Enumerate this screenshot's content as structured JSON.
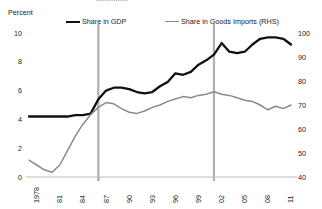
{
  "figure": {
    "clipped_title": "...............",
    "unit_label": "Percent"
  },
  "legend": {
    "position": "top",
    "items": [
      {
        "label": "Share in GDP",
        "color": "#111111",
        "axis": "left"
      },
      {
        "label": "Share in Goods Imports (RHS)",
        "color": "#8a8a8a",
        "axis": "right"
      }
    ]
  },
  "chart_data": {
    "type": "line",
    "title": "",
    "xlabel": "",
    "ylabel": "Percent",
    "ylabel_right": "",
    "grid": false,
    "legend_position": "top",
    "xlim": [
      1978,
      2012
    ],
    "ylim": [
      0,
      10
    ],
    "ylim_right": [
      40,
      100
    ],
    "xticks": [
      1978,
      1981,
      1984,
      1987,
      1990,
      1993,
      1996,
      1999,
      2002,
      2005,
      2008,
      2011
    ],
    "xtick_labels": [
      "1978",
      "81",
      "84",
      "87",
      "90",
      "93",
      "96",
      "99",
      "02",
      "05",
      "08",
      "11"
    ],
    "yticks": [
      0,
      2,
      4,
      6,
      8,
      10
    ],
    "ytick_labels": [
      "0",
      "2",
      "4",
      "6",
      "8",
      "10"
    ],
    "yticks_right": [
      40,
      50,
      60,
      70,
      80,
      90,
      100
    ],
    "ytick_labels_right": [
      "40",
      "50",
      "60",
      "70",
      "80",
      "90",
      "100"
    ],
    "annotations": [
      {
        "type": "vline",
        "x": 1987,
        "color": "#b0b0b0"
      },
      {
        "type": "vline",
        "x": 2002,
        "color": "#b0b0b0"
      }
    ],
    "x": [
      1978,
      1979,
      1980,
      1981,
      1982,
      1983,
      1984,
      1985,
      1986,
      1987,
      1988,
      1989,
      1990,
      1991,
      1992,
      1993,
      1994,
      1995,
      1996,
      1997,
      1998,
      1999,
      2000,
      2001,
      2002,
      2003,
      2004,
      2005,
      2006,
      2007,
      2008,
      2009,
      2010,
      2011,
      2012
    ],
    "series": [
      {
        "name": "Share in GDP",
        "axis": "left",
        "color": "#111111",
        "values": [
          4.2,
          4.2,
          4.2,
          4.2,
          4.2,
          4.2,
          4.3,
          4.3,
          4.4,
          5.4,
          6.0,
          6.2,
          6.2,
          6.1,
          5.9,
          5.8,
          5.9,
          6.3,
          6.6,
          7.2,
          7.1,
          7.3,
          7.8,
          8.1,
          8.5,
          9.3,
          8.7,
          8.6,
          8.7,
          9.2,
          9.6,
          9.7,
          9.7,
          9.6,
          9.2
        ]
      },
      {
        "name": "Share in Goods Imports (RHS)",
        "axis": "right",
        "color": "#8a8a8a",
        "values": [
          47.0,
          45.0,
          43.0,
          42.0,
          45.0,
          51.0,
          57.0,
          62.0,
          66.0,
          69.0,
          71.0,
          70.5,
          68.5,
          67.0,
          66.5,
          67.5,
          69.0,
          70.0,
          71.5,
          72.5,
          73.5,
          73.0,
          74.0,
          74.5,
          75.5,
          74.5,
          74.0,
          73.0,
          72.0,
          71.5,
          70.0,
          68.0,
          69.5,
          68.5,
          70.0
        ]
      }
    ]
  }
}
